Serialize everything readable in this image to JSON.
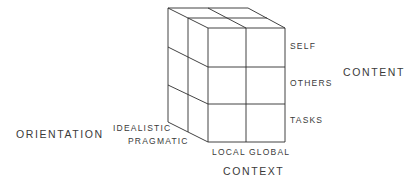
{
  "diagram": {
    "type": "3x2x2 cube model",
    "axes": {
      "content": {
        "title": "CONTENT",
        "levels": [
          "SELF",
          "OTHERS",
          "TASKS"
        ]
      },
      "context": {
        "title": "CONTEXT",
        "levels": [
          "LOCAL",
          "GLOBAL"
        ]
      },
      "orientation": {
        "title": "ORIENTATION",
        "levels": [
          "IDEALISTIC",
          "PRAGMATIC"
        ]
      }
    }
  }
}
